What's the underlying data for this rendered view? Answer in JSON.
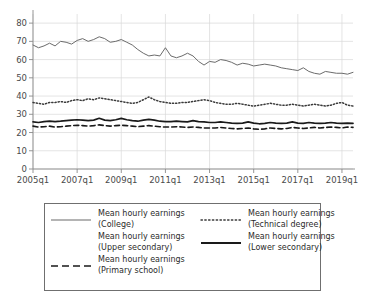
{
  "chart_data": {
    "type": "line",
    "title": "",
    "xlabel": "",
    "ylabel": "",
    "ylim": [
      0,
      85
    ],
    "yticks": [
      0,
      10,
      20,
      30,
      40,
      50,
      60,
      70,
      80
    ],
    "grid": true,
    "legend_position": "bottom",
    "xtick_labels": [
      "2005q1",
      "2007q1",
      "2009q1",
      "2011q1",
      "2013q1",
      "2015q1",
      "2017q1",
      "2019q1"
    ],
    "xtick_indices": [
      0,
      8,
      16,
      24,
      32,
      40,
      48,
      56
    ],
    "x": [
      "2005q1",
      "2005q2",
      "2005q3",
      "2005q4",
      "2006q1",
      "2006q2",
      "2006q3",
      "2006q4",
      "2007q1",
      "2007q2",
      "2007q3",
      "2007q4",
      "2008q1",
      "2008q2",
      "2008q3",
      "2008q4",
      "2009q1",
      "2009q2",
      "2009q3",
      "2009q4",
      "2010q1",
      "2010q2",
      "2010q3",
      "2010q4",
      "2011q1",
      "2011q2",
      "2011q3",
      "2011q4",
      "2012q1",
      "2012q2",
      "2012q3",
      "2012q4",
      "2013q1",
      "2013q2",
      "2013q3",
      "2013q4",
      "2014q1",
      "2014q2",
      "2014q3",
      "2014q4",
      "2015q1",
      "2015q2",
      "2015q3",
      "2015q4",
      "2016q1",
      "2016q2",
      "2016q3",
      "2016q4",
      "2017q1",
      "2017q2",
      "2017q3",
      "2017q4",
      "2018q1",
      "2018q2",
      "2018q3",
      "2018q4",
      "2019q1",
      "2019q2",
      "2019q3"
    ],
    "series": [
      {
        "name": "Mean hourly earnings (College)",
        "key_style": "solid-thin",
        "color": "#6b6b6b",
        "values": [
          68.0,
          66.5,
          67.5,
          69.0,
          67.5,
          70.0,
          69.5,
          68.5,
          70.5,
          71.5,
          70.0,
          71.0,
          72.5,
          71.5,
          69.5,
          70.0,
          71.0,
          69.5,
          68.0,
          65.5,
          63.5,
          62.0,
          62.5,
          62.0,
          66.5,
          62.0,
          61.0,
          62.0,
          63.5,
          62.0,
          59.0,
          57.0,
          59.0,
          58.5,
          60.0,
          59.5,
          58.5,
          57.0,
          58.0,
          57.5,
          56.5,
          57.0,
          57.5,
          57.0,
          56.5,
          55.5,
          55.0,
          54.5,
          54.0,
          55.5,
          53.5,
          52.5,
          52.0,
          53.5,
          53.0,
          52.5,
          52.5,
          52.0,
          53.0
        ]
      },
      {
        "name": "Mean hourly earnings (Technical degree)",
        "key_style": "dotted",
        "color": "#3a3a3a",
        "values": [
          36.5,
          36.0,
          35.5,
          36.5,
          36.5,
          37.0,
          36.5,
          37.5,
          38.0,
          37.5,
          38.5,
          38.0,
          39.0,
          38.5,
          38.0,
          37.5,
          37.0,
          36.5,
          36.0,
          36.5,
          38.0,
          39.5,
          38.0,
          37.0,
          36.5,
          36.0,
          36.0,
          36.5,
          36.5,
          37.0,
          37.5,
          38.0,
          37.5,
          36.5,
          36.0,
          35.5,
          35.5,
          36.0,
          35.5,
          35.0,
          34.5,
          35.0,
          35.5,
          36.0,
          35.5,
          35.0,
          35.0,
          35.5,
          35.0,
          34.5,
          35.0,
          35.5,
          35.0,
          34.5,
          35.0,
          36.0,
          36.5,
          35.0,
          34.5
        ]
      },
      {
        "name": "Mean hourly earnings (Upper secondary)",
        "key_style": "blank",
        "color": "#ffffff",
        "values": [
          25.5,
          25.5,
          25.8,
          26.0,
          25.8,
          26.0,
          26.2,
          26.5,
          26.8,
          26.5,
          26.2,
          26.5,
          26.8,
          26.5,
          26.0,
          26.2,
          26.5,
          26.2,
          26.0,
          25.8,
          26.0,
          26.2,
          26.0,
          25.8,
          25.5,
          25.5,
          25.8,
          25.5,
          25.2,
          25.5,
          25.5,
          25.2,
          25.0,
          25.0,
          25.2,
          25.0,
          24.8,
          24.5,
          24.8,
          25.0,
          24.8,
          24.5,
          24.8,
          25.0,
          24.8,
          24.5,
          24.8,
          25.0,
          24.8,
          25.0,
          25.2,
          25.0,
          24.8,
          25.0,
          25.2,
          25.0,
          24.8,
          25.0,
          24.8
        ]
      },
      {
        "name": "Mean hourly earnings (Lower secondary)",
        "key_style": "solid-thick",
        "color": "#1a1a1a",
        "values": [
          25.8,
          25.5,
          26.0,
          26.2,
          26.0,
          26.2,
          26.5,
          26.8,
          27.0,
          26.8,
          26.5,
          26.8,
          27.8,
          26.8,
          26.5,
          27.0,
          27.8,
          27.0,
          26.5,
          26.2,
          26.8,
          27.2,
          26.8,
          26.2,
          26.0,
          26.0,
          26.2,
          26.0,
          25.8,
          26.5,
          26.0,
          25.8,
          25.5,
          25.5,
          25.8,
          25.5,
          25.2,
          25.0,
          25.2,
          25.8,
          25.2,
          24.8,
          25.0,
          25.5,
          25.2,
          25.0,
          25.2,
          25.8,
          25.2,
          25.0,
          25.5,
          25.2,
          25.0,
          25.2,
          25.5,
          25.2,
          25.0,
          25.2,
          25.0
        ]
      },
      {
        "name": "Mean hourly earnings (Primary school)",
        "key_style": "dashed",
        "color": "#1a1a1a",
        "values": [
          23.5,
          23.0,
          23.2,
          23.5,
          23.0,
          23.2,
          23.5,
          23.8,
          24.0,
          23.8,
          23.5,
          23.8,
          24.2,
          23.8,
          23.5,
          23.8,
          24.0,
          23.8,
          23.5,
          23.2,
          23.5,
          23.8,
          23.5,
          23.2,
          23.0,
          23.0,
          23.2,
          23.0,
          22.8,
          23.0,
          22.8,
          22.5,
          22.5,
          22.5,
          22.8,
          22.5,
          22.2,
          22.0,
          22.2,
          22.5,
          22.0,
          21.8,
          22.0,
          22.5,
          22.2,
          22.0,
          22.2,
          22.8,
          22.5,
          22.2,
          22.5,
          22.8,
          22.5,
          22.8,
          23.0,
          22.8,
          22.5,
          23.0,
          22.8
        ]
      }
    ]
  },
  "legend": {
    "left_column": [
      {
        "line1": "Mean hourly earnings",
        "line2": "(College)",
        "style": "solid-thin"
      },
      {
        "line1": "Mean hourly earnings",
        "line2": "(Upper secondary)",
        "style": "blank"
      },
      {
        "line1": "Mean hourly earnings",
        "line2": "(Primary school)",
        "style": "dashed"
      }
    ],
    "right_column": [
      {
        "line1": "Mean hourly earnings",
        "line2": "(Technical degree)",
        "style": "dotted"
      },
      {
        "line1": "Mean hourly earnings",
        "line2": "(Lower secondary)",
        "style": "solid-thick"
      }
    ]
  }
}
